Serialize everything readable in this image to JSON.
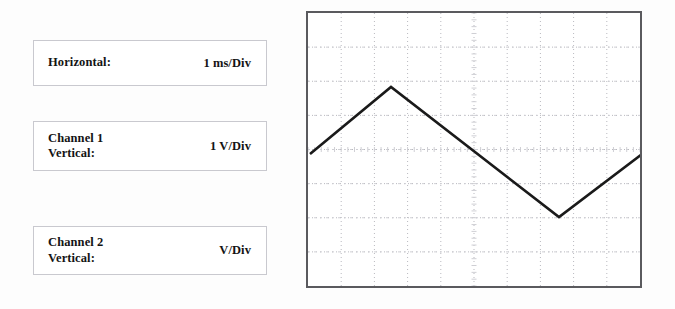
{
  "page": {
    "background_color": "#fdfdfd"
  },
  "settings": {
    "boxes": [
      {
        "name": "horizontal",
        "label": "Horizontal:",
        "value_number": "1",
        "value_unit": "ms/Div"
      },
      {
        "name": "channel-1-vertical",
        "label": "Channel 1\nVertical:",
        "value_number": "1",
        "value_unit": "V/Div"
      },
      {
        "name": "channel-2-vertical",
        "label": "Channel 2\nVertical:",
        "value_number": "",
        "value_unit": "V/Div"
      }
    ]
  },
  "scope": {
    "border_color": "#5a5a5e",
    "background_color": "#ffffff",
    "grid": {
      "columns": 10,
      "rows": 8,
      "dot_color": "#b9b9bf",
      "subtick_color": "#cfcfd4",
      "style": "dotted"
    },
    "waveform": {
      "type": "triangle",
      "color": "#1a1a1a",
      "stroke_width": 2.6,
      "points": [
        {
          "x": 2,
          "y": 141
        },
        {
          "x": 83,
          "y": 74
        },
        {
          "x": 251,
          "y": 204
        },
        {
          "x": 334,
          "y": 141
        }
      ]
    }
  },
  "chart_data": {
    "type": "line",
    "title": "",
    "xlabel": "Time",
    "ylabel": "Voltage",
    "x_unit_per_div": "1 ms/Div",
    "y_unit_per_div": "1 V/Div",
    "divisions_x": 10,
    "divisions_y": 8,
    "series": [
      {
        "name": "Channel 1",
        "waveform": "triangle",
        "points_div": [
          {
            "x": 0.0,
            "y": 0.25
          },
          {
            "x": 2.5,
            "y": 2.2
          },
          {
            "x": 7.4,
            "y": -1.55
          },
          {
            "x": 10.0,
            "y": 0.25
          }
        ]
      }
    ],
    "xlim": [
      0,
      10
    ],
    "ylim": [
      -4,
      4
    ],
    "grid": true,
    "legend": "none"
  }
}
